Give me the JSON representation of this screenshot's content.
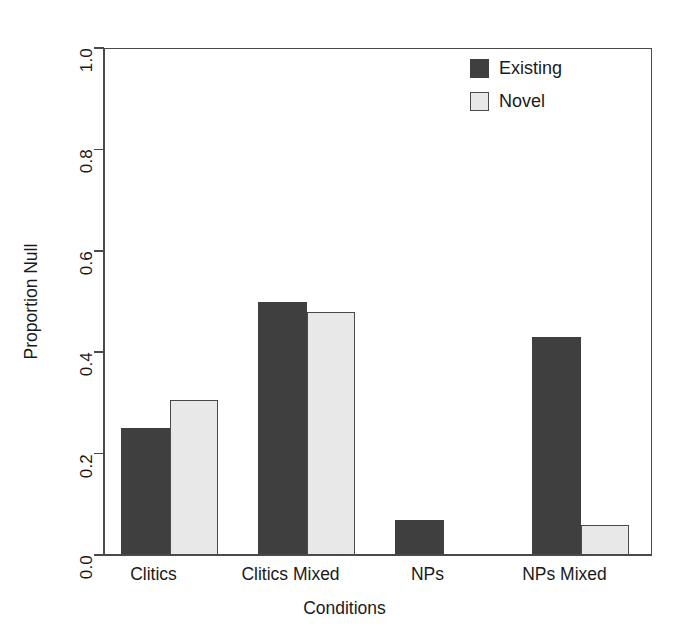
{
  "chart_data": {
    "type": "bar",
    "title": "",
    "subtitle": "",
    "xlabel": "Conditions",
    "ylabel": "Proportion Null",
    "categories": [
      "Clitics",
      "Clitics Mixed",
      "NPs",
      "NPs Mixed"
    ],
    "series": [
      {
        "name": "Existing",
        "color": "#3f3f3f",
        "values": [
          0.25,
          0.5,
          0.07,
          0.43
        ]
      },
      {
        "name": "Novel",
        "color": "#e8e8e8",
        "values": [
          0.305,
          0.48,
          0.0,
          0.06
        ]
      }
    ],
    "ylim": [
      0.0,
      1.0
    ],
    "ytick_labels": [
      "0.0",
      "0.2",
      "0.4",
      "0.6",
      "0.8",
      "1.0"
    ],
    "ytick_values": [
      0.0,
      0.2,
      0.4,
      0.6,
      0.8,
      1.0
    ],
    "grid": false,
    "legend_position": "top-right",
    "legend_entries": [
      "Existing",
      "Novel"
    ],
    "annotations": []
  },
  "axes": {
    "y_title": "Proportion Null",
    "x_title": "Conditions"
  },
  "legend": {
    "items": [
      {
        "label": "Existing",
        "swatch": "dark-square-swatch"
      },
      {
        "label": "Novel",
        "swatch": "light-square-swatch"
      }
    ]
  },
  "colors": {
    "existing_fill": "#3f3f3f",
    "novel_fill": "#e8e8e8",
    "axis": "#4a4a4a",
    "text": "#1a1a1a",
    "background": "#ffffff"
  }
}
